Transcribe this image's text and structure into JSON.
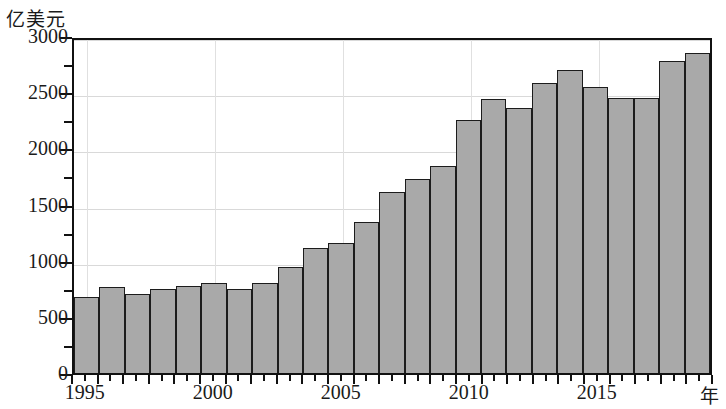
{
  "chart_data": {
    "type": "bar",
    "title": "",
    "ylabel": "亿美元",
    "xlabel": "年",
    "ylim": [
      0,
      3000
    ],
    "ytick_values": [
      0,
      500,
      1000,
      1500,
      2000,
      2500,
      3000
    ],
    "ytick_labels": [
      "0",
      "500",
      "1000",
      "1500",
      "2000",
      "2500",
      "3000"
    ],
    "yminor_step": 250,
    "grid": true,
    "legend": null,
    "xtick_labels": [
      "1995",
      "2000",
      "2005",
      "2010",
      "2015"
    ],
    "categories": [
      "1995",
      "1996",
      "1997",
      "1998",
      "1999",
      "2000",
      "2001",
      "2002",
      "2003",
      "2004",
      "2005",
      "2006",
      "2007",
      "2008",
      "2009",
      "2010",
      "2011",
      "2012",
      "2013",
      "2014",
      "2015",
      "2016",
      "2017",
      "2018",
      "2019"
    ],
    "values": [
      680,
      770,
      700,
      750,
      775,
      800,
      750,
      805,
      945,
      1110,
      1160,
      1340,
      1610,
      1725,
      1845,
      2250,
      2440,
      2355,
      2580,
      2700,
      2550,
      2450,
      2450,
      2780,
      2850
    ],
    "bar_color": "#a9a9a9",
    "bar_edge_color": "#1c1c1c",
    "axis_color": "#111111",
    "grid_color": "#d9d9d9"
  }
}
